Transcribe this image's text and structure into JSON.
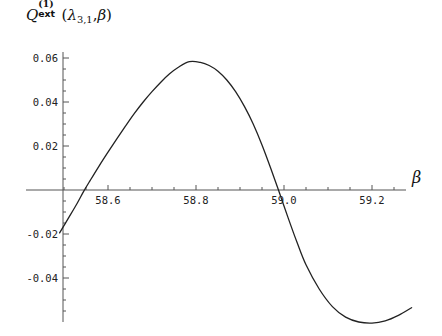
{
  "chart_data": {
    "type": "line",
    "title_parts": {
      "q": "Q",
      "superscript": "(1)",
      "subscript": "ext",
      "open_paren": "(",
      "lambda": "λ",
      "lambda_sub": "3,1",
      "comma": ",",
      "beta": "β",
      "close_paren": ")"
    },
    "xlabel": "β",
    "ylabel": "",
    "xlim": [
      58.49,
      59.29
    ],
    "ylim": [
      -0.066,
      0.064
    ],
    "grid": false,
    "legend": null,
    "xticks": [
      58.6,
      58.8,
      59.0,
      59.2
    ],
    "xtick_labels": [
      "58.6",
      "58.8",
      "59.0",
      "59.2"
    ],
    "yticks": [
      0.06,
      0.04,
      0.02,
      -0.02,
      -0.04
    ],
    "ytick_labels": [
      "0.06",
      "0.04",
      "0.02",
      "-0.02",
      "-0.04"
    ],
    "zero_line_y": 0,
    "series": [
      {
        "name": "Qext",
        "color": "#222222",
        "linewidth": 1.3,
        "x": [
          58.49,
          58.51,
          58.53,
          58.545,
          58.56,
          58.58,
          58.6,
          58.62,
          58.64,
          58.66,
          58.68,
          58.7,
          58.72,
          58.74,
          58.76,
          58.785,
          58.81,
          58.83,
          58.85,
          58.87,
          58.89,
          58.91,
          58.93,
          58.95,
          58.97,
          58.99,
          59.01,
          59.03,
          59.05,
          59.08,
          59.11,
          59.14,
          59.17,
          59.2,
          59.23,
          59.26,
          59.29
        ],
        "y": [
          -0.0195,
          -0.0128,
          -0.006,
          -0.0005,
          0.0045,
          0.011,
          0.0172,
          0.0232,
          0.0291,
          0.0348,
          0.04,
          0.0447,
          0.049,
          0.0528,
          0.0558,
          0.0583,
          0.058,
          0.0566,
          0.054,
          0.05,
          0.0447,
          0.038,
          0.03,
          0.0205,
          0.0098,
          -0.0015,
          -0.013,
          -0.024,
          -0.034,
          -0.045,
          -0.053,
          -0.0578,
          -0.06,
          -0.0605,
          -0.0595,
          -0.057,
          -0.0535
        ]
      }
    ],
    "annotations": {
      "peak": {
        "x": 58.785,
        "y": 0.0583
      },
      "minimum": {
        "x": 59.2,
        "y": -0.0605
      },
      "zero_crossings": [
        58.546,
        58.987
      ]
    }
  },
  "axes": {
    "x_axis_name": "horizontal-zero-axis",
    "y_axis_name": "vertical-value-axis"
  }
}
